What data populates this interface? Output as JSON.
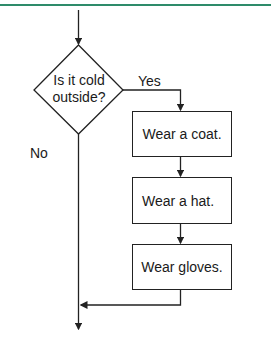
{
  "colors": {
    "accent_rule": "#2e8b6a",
    "stroke": "#222222"
  },
  "flowchart": {
    "decision": {
      "line1": "Is it cold",
      "line2": "outside?"
    },
    "yes_label": "Yes",
    "no_label": "No",
    "steps": [
      {
        "label": "Wear a coat."
      },
      {
        "label": "Wear a hat."
      },
      {
        "label": "Wear gloves."
      }
    ]
  }
}
